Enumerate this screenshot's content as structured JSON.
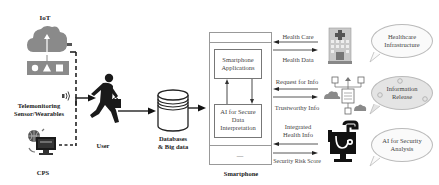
{
  "left": {
    "iot_label": "IoT",
    "telemonitoring_label_line1": "Telemonitoring",
    "telemonitoring_label_line2": "Sensor/Wearables",
    "cps_label": "CPS"
  },
  "center": {
    "user_label": "User",
    "database_label_line1": "Databases",
    "database_label_line2": "& Big data"
  },
  "smartphone": {
    "label": "Smartphone",
    "apps_box_line1": "Smartphone",
    "apps_box_line2": "Applications",
    "ai_box_line1": "AI for Secure",
    "ai_box_line2": "Data",
    "ai_box_line3": "Interpretation",
    "bottom_mark": "—"
  },
  "flows": [
    {
      "top_label": "Health Care",
      "bottom_label": "Health Data"
    },
    {
      "top_label": "Request for Info",
      "bottom_label": "Trustworthy Info"
    },
    {
      "top_label_line1": "Integrated",
      "top_label_line2": "Health Info",
      "bottom_label": "Security Risk Score"
    }
  ],
  "bubbles": [
    {
      "line1": "Healthcare",
      "line2": "Infrastructure"
    },
    {
      "line1": "Information",
      "line2": "Release"
    },
    {
      "line1": "AI for Security",
      "line2": "Analysis"
    }
  ],
  "colors": {
    "icon_gray": "#8a8a8a",
    "dark": "#1a1a1a",
    "line": "#222222"
  }
}
